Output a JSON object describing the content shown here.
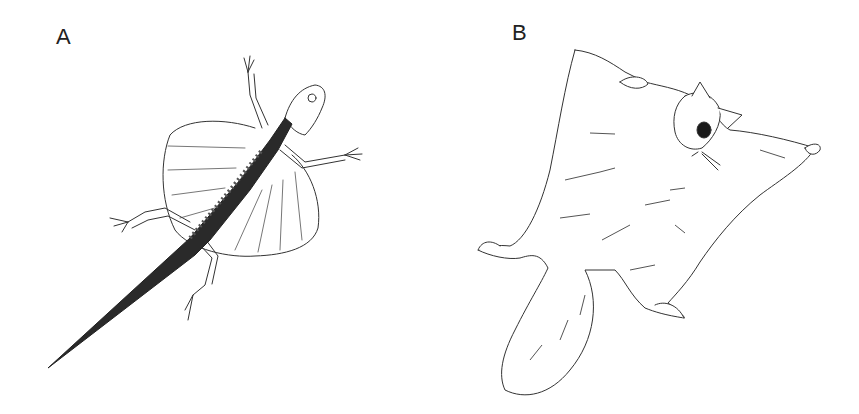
{
  "figure": {
    "panels": [
      {
        "label": "A",
        "subject": "flying lizard (gliding, patagium extended)",
        "icon": "lizard-illustration"
      },
      {
        "label": "B",
        "subject": "flying squirrel (gliding, membrane extended)",
        "icon": "squirrel-illustration"
      }
    ],
    "colors": {
      "background": "#ffffff",
      "ink": "#222222"
    }
  }
}
